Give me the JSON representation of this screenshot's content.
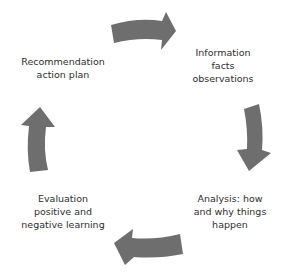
{
  "diagram": {
    "type": "cycle",
    "arrow_color": "#6e6e6e",
    "text_color": "#2e2e2e",
    "nodes": [
      {
        "id": "information",
        "lines": [
          "Information",
          "facts",
          "observations"
        ]
      },
      {
        "id": "analysis",
        "lines": [
          "Analysis: how",
          "and why things",
          "happen"
        ]
      },
      {
        "id": "evaluation",
        "lines": [
          "Evaluation",
          "positive and",
          "negative learning"
        ]
      },
      {
        "id": "recommendation",
        "lines": [
          "Recommendation",
          "action plan"
        ]
      }
    ],
    "edges": [
      {
        "from": "recommendation",
        "to": "information",
        "direction": "clockwise"
      },
      {
        "from": "information",
        "to": "analysis",
        "direction": "clockwise"
      },
      {
        "from": "analysis",
        "to": "evaluation",
        "direction": "clockwise"
      },
      {
        "from": "evaluation",
        "to": "recommendation",
        "direction": "clockwise"
      }
    ]
  }
}
